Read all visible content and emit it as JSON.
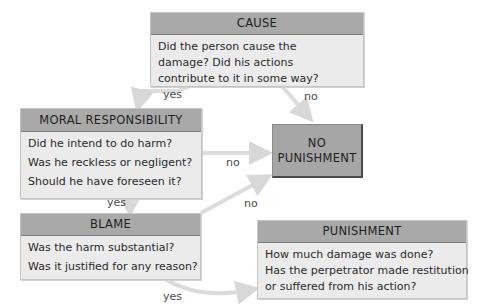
{
  "diagram": {
    "nodes": {
      "cause": {
        "title": "CAUSE",
        "lines": [
          "Did the person cause the",
          "damage? Did his actions",
          "contribute to it in some way?"
        ]
      },
      "moral_responsibility": {
        "title": "MORAL RESPONSIBILITY",
        "lines": [
          "Did he intend to do harm?",
          "Was he reckless or negligent?",
          "Should he have foreseen it?"
        ]
      },
      "no_punishment": {
        "lines": [
          "NO",
          "PUNISHMENT"
        ]
      },
      "blame": {
        "title": "BLAME",
        "lines": [
          "Was the harm substantial?",
          "Was it justified for any reason?"
        ]
      },
      "punishment": {
        "title": "PUNISHMENT",
        "lines": [
          "How much damage was done?",
          "Has the perpetrator made restitution",
          "or suffered from his action?"
        ]
      }
    },
    "edges": [
      {
        "from": "cause",
        "to": "moral_responsibility",
        "label": "yes"
      },
      {
        "from": "cause",
        "to": "no_punishment",
        "label": "no"
      },
      {
        "from": "moral_responsibility",
        "to": "no_punishment",
        "label": "no"
      },
      {
        "from": "moral_responsibility",
        "to": "blame",
        "label": "yes"
      },
      {
        "from": "blame",
        "to": "no_punishment",
        "label": "no"
      },
      {
        "from": "blame",
        "to": "punishment",
        "label": "yes"
      }
    ],
    "colors": {
      "header_fill": "#a9a9a9",
      "box_fill": "#ebebeb",
      "terminal_fill": "#a6a6a6",
      "arrow": "#dcdcdc"
    }
  }
}
